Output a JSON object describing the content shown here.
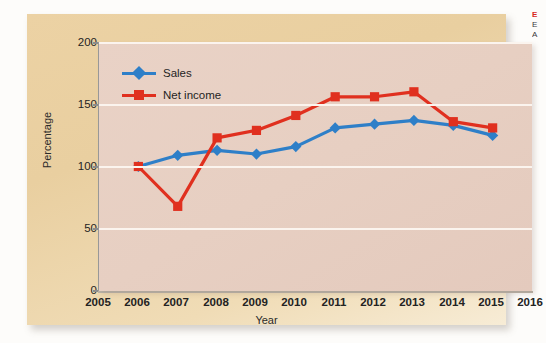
{
  "chart_data": {
    "type": "line",
    "title": "",
    "subtitle": "",
    "xlabel": "Year",
    "ylabel": "Percentage",
    "x": [
      2006,
      2007,
      2008,
      2009,
      2010,
      2011,
      2012,
      2013,
      2014,
      2015
    ],
    "categories": [
      "2006",
      "2007",
      "2008",
      "2009",
      "2010",
      "2011",
      "2012",
      "2013",
      "2014",
      "2015"
    ],
    "xtick_labels": [
      "2005",
      "2006",
      "2007",
      "2008",
      "2009",
      "2010",
      "2011",
      "2012",
      "2013",
      "2014",
      "2015",
      "2016"
    ],
    "ytick_labels": [
      "0",
      "50",
      "100",
      "150",
      "200"
    ],
    "yticks": [
      0,
      50,
      100,
      150,
      200
    ],
    "xlim": [
      2005,
      2016
    ],
    "ylim": [
      0,
      200
    ],
    "grid": "horizontal",
    "legend_position": "top-left",
    "series": [
      {
        "name": "Sales",
        "color": "#2e7fc8",
        "marker": "diamond",
        "values": [
          100,
          109,
          113,
          110,
          116,
          131,
          134,
          137,
          133,
          125
        ]
      },
      {
        "name": "Net income",
        "color": "#e0301f",
        "marker": "square",
        "values": [
          100,
          68,
          123,
          129,
          141,
          156,
          156,
          160,
          136,
          131
        ]
      }
    ]
  },
  "axes": {
    "y_title": "Percentage",
    "x_title": "Year"
  },
  "legend": {
    "items": [
      {
        "label": "Sales",
        "color": "#2e7fc8",
        "marker": "diamond"
      },
      {
        "label": "Net income",
        "color": "#e0301f",
        "marker": "square"
      }
    ]
  },
  "colors": {
    "sales": "#2e7fc8",
    "net_income": "#e0301f",
    "card_background": "#e9cfa0",
    "plot_background": "#e7cfc2",
    "gridline": "#fbf4ee"
  },
  "caption_fragment": {
    "line1": "E",
    "line2": "E",
    "line3": "A"
  }
}
